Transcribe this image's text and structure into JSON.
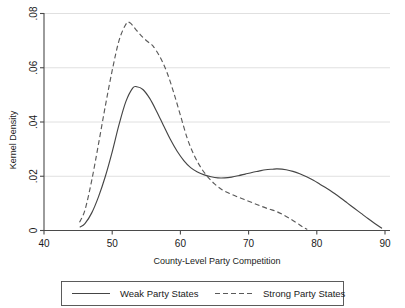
{
  "chart_data": {
    "type": "line",
    "title": "",
    "subtitle": "",
    "xlabel": "County-Level Party Competition",
    "ylabel": "Kernel Density",
    "xlim": [
      40,
      90
    ],
    "ylim": [
      0,
      0.08
    ],
    "xticks": [
      40,
      50,
      60,
      70,
      80,
      90
    ],
    "xtick_labels": [
      "40",
      "50",
      "60",
      "70",
      "80",
      "90"
    ],
    "yticks": [
      0,
      0.02,
      0.04,
      0.06,
      0.08
    ],
    "ytick_labels": [
      "0",
      ".02",
      ".04",
      ".06",
      ".08"
    ],
    "grid": "horizontal",
    "legend_position": "bottom",
    "series": [
      {
        "name": "Weak Party States",
        "style": "solid",
        "color": "#454545",
        "x": [
          45.3,
          46.0,
          47.0,
          48.0,
          49.0,
          50.0,
          51.0,
          52.0,
          53.0,
          53.6,
          54.5,
          55.5,
          56.5,
          57.5,
          58.5,
          59.5,
          60.5,
          61.5,
          62.5,
          63.5,
          64.5,
          65.5,
          66.5,
          67.5,
          68.5,
          69.5,
          70.5,
          71.5,
          72.5,
          73.5,
          74.2,
          75.5,
          76.5,
          77.5,
          78.5,
          79.5,
          80.5,
          81.5,
          82.5,
          83.5,
          84.5,
          85.5,
          86.5,
          87.5,
          88.5,
          89.5
        ],
        "y": [
          0.0013,
          0.0025,
          0.0065,
          0.0125,
          0.02,
          0.029,
          0.039,
          0.0475,
          0.0525,
          0.053,
          0.052,
          0.0487,
          0.044,
          0.0388,
          0.0337,
          0.0293,
          0.0258,
          0.0232,
          0.0216,
          0.0205,
          0.0198,
          0.0194,
          0.0194,
          0.0197,
          0.0202,
          0.0208,
          0.0214,
          0.0219,
          0.0224,
          0.0226,
          0.0227,
          0.0224,
          0.0218,
          0.0209,
          0.0198,
          0.0185,
          0.017,
          0.0155,
          0.0138,
          0.012,
          0.0101,
          0.0082,
          0.0063,
          0.0044,
          0.0026,
          0.0009
        ]
      },
      {
        "name": "Strong Party States",
        "style": "dashed",
        "color": "#5a5a5a",
        "x": [
          45.2,
          46.0,
          47.0,
          48.0,
          49.0,
          50.0,
          51.0,
          52.0,
          52.6,
          53.5,
          54.5,
          55.5,
          56.0,
          57.0,
          58.0,
          59.0,
          60.0,
          61.0,
          62.0,
          63.0,
          64.0,
          65.0,
          66.0,
          67.0,
          68.0,
          69.0,
          70.0,
          71.0,
          72.0,
          73.0,
          74.0,
          75.0,
          76.0,
          77.0,
          78.0,
          78.6
        ],
        "y": [
          0.003,
          0.0075,
          0.0185,
          0.032,
          0.046,
          0.059,
          0.07,
          0.076,
          0.0766,
          0.074,
          0.0712,
          0.069,
          0.068,
          0.064,
          0.0585,
          0.051,
          0.0425,
          0.034,
          0.0278,
          0.0232,
          0.0198,
          0.0172,
          0.0152,
          0.0139,
          0.0128,
          0.0118,
          0.0108,
          0.0098,
          0.0088,
          0.0079,
          0.0071,
          0.0059,
          0.0045,
          0.0029,
          0.0012,
          0.0004
        ]
      }
    ]
  },
  "legend": {
    "items": [
      {
        "label": "Weak Party States",
        "style": "solid"
      },
      {
        "label": "Strong Party States",
        "style": "dashed"
      }
    ]
  }
}
